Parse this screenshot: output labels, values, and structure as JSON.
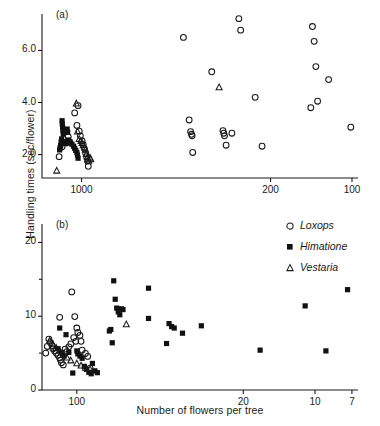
{
  "figure": {
    "ylabel": "Handling times (sec/flower)",
    "xlabel": "Number of flowers per tree",
    "panel_a_tag": "(a)",
    "panel_b_tag": "(b)"
  },
  "legend": {
    "position": "top-right of panel b",
    "items": [
      {
        "glyph": "circle-open-icon",
        "symbol": "○",
        "label": "Loxops"
      },
      {
        "glyph": "square-filled-icon",
        "symbol": "■",
        "label": "Himatione"
      },
      {
        "glyph": "triangle-open-icon",
        "symbol": "△",
        "label": "Vestaria"
      }
    ]
  },
  "chart_data": [
    {
      "id": "panel-a",
      "type": "scatter",
      "title": "(a)",
      "xlabel": "Number of flowers per tree",
      "ylabel": "Handling times (sec/flower)",
      "xscale": "log-reversed",
      "xlim": [
        1400,
        95
      ],
      "ylim": [
        1.1,
        7.4
      ],
      "xticks": [
        1000,
        200,
        100
      ],
      "xtick_labels": [
        "1000",
        "200",
        "100"
      ],
      "yticks": [
        2.0,
        4.0,
        6.0
      ],
      "ytick_labels": [
        "2.0",
        "4.0",
        "6.0"
      ],
      "grid": false,
      "series": [
        {
          "name": "Loxops",
          "marker": "circle-open",
          "points": [
            [
              1030,
              3.88
            ],
            [
              1060,
              3.6
            ],
            [
              1040,
              3.12
            ],
            [
              1020,
              2.9
            ],
            [
              1010,
              2.72
            ],
            [
              995,
              2.52
            ],
            [
              985,
              2.38
            ],
            [
              975,
              2.22
            ],
            [
              965,
              2.05
            ],
            [
              958,
              1.92
            ],
            [
              950,
              1.75
            ],
            [
              944,
              1.55
            ],
            [
              1120,
              2.68
            ],
            [
              1140,
              2.45
            ],
            [
              1180,
              2.3
            ],
            [
              1210,
              1.92
            ],
            [
              420,
              6.5
            ],
            [
              400,
              3.33
            ],
            [
              395,
              2.88
            ],
            [
              392,
              2.78
            ],
            [
              390,
              2.72
            ],
            [
              388,
              2.08
            ],
            [
              330,
              5.18
            ],
            [
              300,
              2.92
            ],
            [
              298,
              2.82
            ],
            [
              296,
              2.72
            ],
            [
              292,
              2.36
            ],
            [
              278,
              2.82
            ],
            [
              262,
              7.22
            ],
            [
              258,
              6.78
            ],
            [
              228,
              4.2
            ],
            [
              215,
              2.32
            ],
            [
              140,
              6.92
            ],
            [
              138,
              6.35
            ],
            [
              136,
              5.38
            ],
            [
              134,
              4.05
            ],
            [
              142,
              3.8
            ],
            [
              122,
              4.88
            ],
            [
              101,
              3.05
            ]
          ]
        },
        {
          "name": "Himatione",
          "marker": "square-filled",
          "points": [
            [
              1180,
              3.3
            ],
            [
              1178,
              3.18
            ],
            [
              1175,
              3.05
            ],
            [
              1172,
              2.92
            ],
            [
              1168,
              2.78
            ],
            [
              1185,
              2.6
            ],
            [
              1190,
              2.48
            ],
            [
              1195,
              2.35
            ],
            [
              1200,
              2.26
            ],
            [
              1205,
              2.18
            ],
            [
              1130,
              2.98
            ],
            [
              1125,
              2.86
            ],
            [
              1118,
              2.56
            ],
            [
              1100,
              2.48
            ],
            [
              1085,
              2.4
            ],
            [
              1070,
              2.32
            ],
            [
              1060,
              2.24
            ],
            [
              1050,
              2.16
            ],
            [
              1040,
              2.08
            ],
            [
              1035,
              1.98
            ],
            [
              1030,
              1.86
            ],
            [
              1140,
              2.5
            ],
            [
              1145,
              2.42
            ]
          ]
        },
        {
          "name": "Vestaria",
          "marker": "triangle-open",
          "points": [
            [
              1045,
              3.96
            ],
            [
              1035,
              2.88
            ],
            [
              1020,
              2.6
            ],
            [
              1005,
              2.52
            ],
            [
              995,
              2.44
            ],
            [
              985,
              2.36
            ],
            [
              975,
              2.28
            ],
            [
              968,
              2.18
            ],
            [
              960,
              2.02
            ],
            [
              952,
              1.9
            ],
            [
              946,
              1.82
            ],
            [
              940,
              1.76
            ],
            [
              1235,
              1.38
            ],
            [
              1090,
              2.45
            ],
            [
              930,
              1.88
            ],
            [
              925,
              1.82
            ],
            [
              310,
              4.58
            ]
          ]
        }
      ]
    },
    {
      "id": "panel-b",
      "type": "scatter",
      "title": "(b)",
      "xlabel": "Number of flowers per tree",
      "ylabel": "Handling times (sec/flower)",
      "xscale": "log-reversed",
      "xlim": [
        140,
        6.6
      ],
      "ylim": [
        0,
        22.5
      ],
      "xticks": [
        100,
        20,
        10,
        7
      ],
      "xtick_labels": [
        "100",
        "20",
        "10",
        "7"
      ],
      "yticks": [
        0,
        10,
        20
      ],
      "ytick_labels": [
        "0",
        "10",
        "20"
      ],
      "yminor_ticks": [
        5,
        15
      ],
      "grid": false,
      "series": [
        {
          "name": "Loxops",
          "marker": "circle-open",
          "points": [
            [
              118,
              9.85
            ],
            [
              105,
              13.3
            ],
            [
              102,
              9.95
            ],
            [
              100,
              8.4
            ],
            [
              99,
              7.8
            ],
            [
              97,
              7.4
            ],
            [
              131,
              6.9
            ],
            [
              129,
              6.4
            ],
            [
              127,
              6.0
            ],
            [
              126,
              5.6
            ],
            [
              124,
              5.3
            ],
            [
              122,
              5.0
            ],
            [
              120,
              4.7
            ],
            [
              118,
              4.35
            ],
            [
              117,
              4.05
            ],
            [
              116,
              3.7
            ],
            [
              114,
              3.4
            ],
            [
              112,
              5.55
            ],
            [
              110,
              5.2
            ],
            [
              108,
              5.85
            ],
            [
              106,
              6.25
            ],
            [
              95,
              5.4
            ],
            [
              92,
              4.95
            ],
            [
              90,
              4.55
            ],
            [
              103,
              7.1
            ],
            [
              101,
              6.6
            ],
            [
              133,
              5.9
            ],
            [
              135,
              5.0
            ],
            [
              88,
              2.95
            ],
            [
              96,
              6.6
            ]
          ]
        },
        {
          "name": "Himatione",
          "marker": "square-filled",
          "points": [
            [
              70,
              14.8
            ],
            [
              69,
              12.3
            ],
            [
              68,
              11.1
            ],
            [
              67,
              10.6
            ],
            [
              66,
              10.2
            ],
            [
              65,
              11.0
            ],
            [
              64,
              10.9
            ],
            [
              72,
              8.2
            ],
            [
              73,
              8.0
            ],
            [
              71,
              6.4
            ],
            [
              50,
              13.8
            ],
            [
              50,
              9.7
            ],
            [
              41,
              9.0
            ],
            [
              40,
              8.6
            ],
            [
              39,
              8.4
            ],
            [
              42,
              6.3
            ],
            [
              36,
              7.7
            ],
            [
              30,
              8.7
            ],
            [
              17,
              5.4
            ],
            [
              11,
              11.4
            ],
            [
              9,
              5.3
            ],
            [
              7.3,
              13.6
            ],
            [
              118,
              8.4
            ],
            [
              111,
              7.5
            ],
            [
              108,
              5.1
            ],
            [
              100,
              5.3
            ],
            [
              99,
              4.9
            ],
            [
              97,
              4.6
            ],
            [
              95,
              4.3
            ],
            [
              104,
              2.3
            ],
            [
              93,
              3.2
            ],
            [
              91,
              2.8
            ],
            [
              89,
              2.4
            ],
            [
              87,
              2.2
            ],
            [
              120,
              5.6
            ],
            [
              116,
              5.1
            ],
            [
              113,
              4.6
            ],
            [
              86,
              3.6
            ],
            [
              84,
              2.6
            ],
            [
              82,
              2.35
            ]
          ]
        },
        {
          "name": "Vestaria",
          "marker": "triangle-open",
          "points": [
            [
              62,
              8.9
            ],
            [
              126,
              6.2
            ],
            [
              122,
              5.7
            ],
            [
              118,
              5.3
            ],
            [
              114,
              4.8
            ],
            [
              110,
              4.4
            ],
            [
              106,
              4.0
            ],
            [
              100,
              3.6
            ],
            [
              96,
              3.3
            ],
            [
              92,
              3.0
            ],
            [
              88,
              2.8
            ],
            [
              130,
              6.7
            ]
          ]
        }
      ]
    }
  ]
}
